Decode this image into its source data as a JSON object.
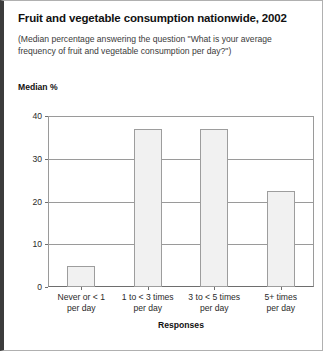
{
  "figure": {
    "title": "Fruit and vegetable consumption nationwide, 2002",
    "subtitle": "(Median percentage answering the question \"What is your average frequency of fruit and vegetable consumption per day?\")"
  },
  "chart_data": {
    "type": "bar",
    "title": "Fruit and vegetable consumption nationwide, 2002",
    "subtitle": "(Median percentage answering the question \"What is your average frequency of fruit and vegetable consumption per day?\")",
    "xlabel": "Responses",
    "ylabel": "Median %",
    "ylim": [
      0,
      40
    ],
    "yticks": [
      0,
      10,
      20,
      30,
      40
    ],
    "ytick_labels": [
      "0",
      "10",
      "20",
      "30",
      "40"
    ],
    "grid": true,
    "legend": false,
    "categories": [
      "Never or < 1 per day",
      "1 to < 3 times per day",
      "3 to < 5 times per day",
      "5+ times per day"
    ],
    "category_lines": [
      [
        "Never or < 1",
        "per day"
      ],
      [
        "1 to < 3 times",
        "per day"
      ],
      [
        "3 to < 5 times",
        "per day"
      ],
      [
        "5+ times",
        "per day"
      ]
    ],
    "values": [
      5,
      37,
      37,
      22.5
    ],
    "bar_fill": "#f1f1f1",
    "bar_edge": "#9d9d9d"
  }
}
